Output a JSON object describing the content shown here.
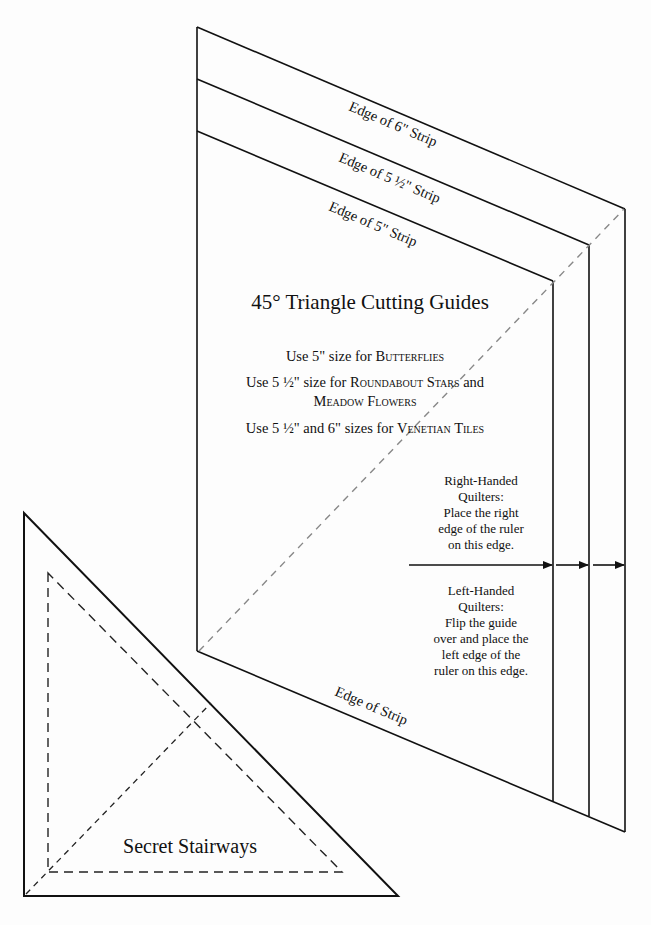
{
  "guide": {
    "title": "45° Triangle Cutting Guides",
    "strip_labels": {
      "six": "Edge of 6\" Strip",
      "five_half": "Edge of 5 ½\" Strip",
      "five": "Edge of 5\" Strip",
      "bottom": "Edge of Strip"
    },
    "uses": [
      {
        "prefix": "Use 5\" size for ",
        "pattern": "Butterflies",
        "suffix": ""
      },
      {
        "prefix": "Use 5 ½\" size for ",
        "pattern": "Roundabout Stars",
        "suffix": " and",
        "line2": "Meadow Flowers"
      },
      {
        "prefix": "Use 5 ½\" and 6\" sizes for ",
        "pattern": "Venetian Tiles",
        "suffix": ""
      }
    ],
    "right_handed": {
      "heading1": "Right-Handed",
      "heading2": "Quilters:",
      "line1": "Place the right",
      "line2": "edge of the ruler",
      "line3": "on this edge."
    },
    "left_handed": {
      "heading1": "Left-Handed",
      "heading2": "Quilters:",
      "line1": "Flip the guide",
      "line2": "over and place the",
      "line3": "left edge of the",
      "line4": "ruler on this edge."
    }
  },
  "triangle": {
    "label": "Secret Stairways"
  },
  "colors": {
    "line": "#111111",
    "dashed_guide": "#888888",
    "background": "#fdfdfd"
  }
}
